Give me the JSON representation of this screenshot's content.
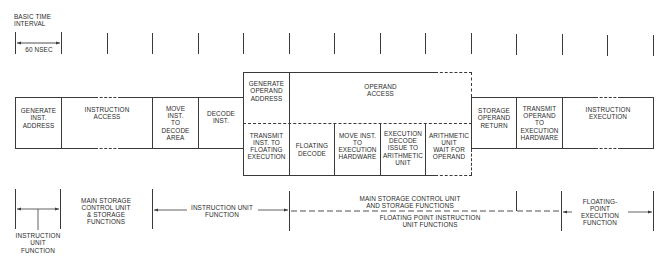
{
  "header": {
    "title": "BASIC TIME\nINTERVAL",
    "interval_label": "60 NSEC"
  },
  "timeline": {
    "tick_positions_px": [
      15,
      61,
      107,
      152,
      198,
      243,
      289,
      334,
      380,
      425,
      471,
      516,
      562,
      607,
      653
    ]
  },
  "pipeline_row": {
    "stages": [
      {
        "id": "generate-inst-address",
        "label": "GENERATE\nINST.\nADDRESS"
      },
      {
        "id": "instruction-access",
        "label": "INSTRUCTION\nACCESS"
      },
      {
        "id": "move-inst-to-decode-area",
        "label": "MOVE\nINST.\nTO\nDECODE\nAREA"
      },
      {
        "id": "decode-inst",
        "label": "DECODE\nINST."
      },
      {
        "id": "storage-operand-return",
        "label": "STORAGE\nOPERAND\nRETURN"
      },
      {
        "id": "transmit-operand-to-execution-hardware",
        "label": "TRANSMIT\nOPERAND\nTO\nEXECUTION\nHARDWARE"
      },
      {
        "id": "instruction-execution",
        "label": "INSTRUCTION\nEXECUTION"
      }
    ]
  },
  "operand_block": {
    "upper": [
      {
        "id": "generate-operand-address",
        "label": "GENERATE\nOPERAND\nADDRESS"
      },
      {
        "id": "operand-access",
        "label": "OPERAND\nACCESS"
      }
    ],
    "lower": [
      {
        "id": "transmit-inst-to-floating-execution",
        "label": "TRANSMIT\nINST. TO\nFLOATING\nEXECUTION"
      },
      {
        "id": "floating-decode",
        "label": "FLOATING\nDECODE"
      },
      {
        "id": "move-inst-to-execution-hardware",
        "label": "MOVE INST.\nTO\nEXECUTION\nHARDWARE"
      },
      {
        "id": "execution-decode-issue",
        "label": "EXECUTION\nDECODE\nISSUE TO\nARITHMETIC\nUNIT"
      },
      {
        "id": "arithmetic-unit-wait",
        "label": "ARITHMETIC\nUNIT\nWAIT FOR\nOPERAND"
      }
    ]
  },
  "function_legend": {
    "instruction_unit_function_left": "INSTRUCTION\nUNIT\nFUNCTION",
    "main_storage_control_left": "MAIN STORAGE\nCONTROL UNIT\n& STORAGE\nFUNCTIONS",
    "instruction_unit_function_mid": "INSTRUCTION UNIT\nFUNCTION",
    "main_storage_control_mid": "MAIN STORAGE CONTROL UNIT\nAND STORAGE FUNCTIONS",
    "floating_point_instruction_unit": "FLOATING POINT INSTRUCTION\nUNIT FUNCTIONS",
    "floating_point_execution": "FLOATING-\nPOINT\nEXECUTION\nFUNCTION"
  },
  "colors": {
    "line": "#3a3a3a",
    "text": "#2a2a2a",
    "background": "#ffffff"
  }
}
